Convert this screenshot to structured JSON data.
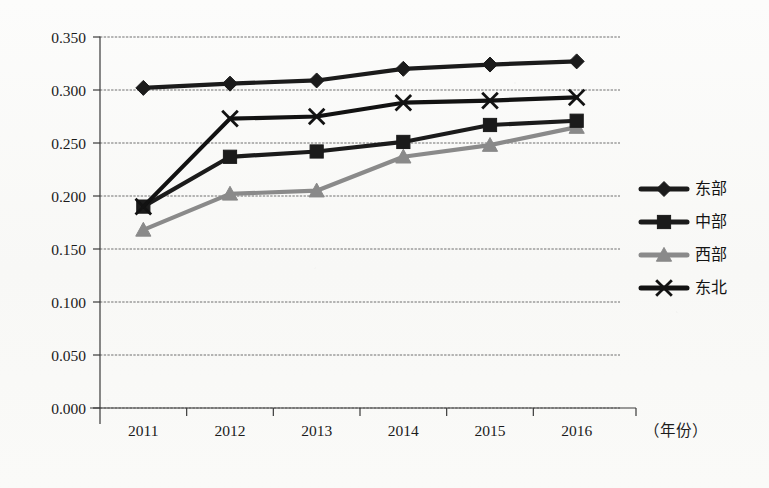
{
  "chart_data": {
    "type": "line",
    "title": "",
    "subtitle": "",
    "xlabel": "（年份）",
    "ylabel": "",
    "x": [
      "2011",
      "2012",
      "2013",
      "2014",
      "2015",
      "2016"
    ],
    "categories": [
      "2011",
      "2012",
      "2013",
      "2014",
      "2015",
      "2016"
    ],
    "ylim": [
      0.0,
      0.35
    ],
    "ytick_step": 0.05,
    "ytick_labels": [
      "0.000",
      "0.050",
      "0.100",
      "0.150",
      "0.200",
      "0.250",
      "0.300",
      "0.350"
    ],
    "ytick_values": [
      0.0,
      0.05,
      0.1,
      0.15,
      0.2,
      0.25,
      0.3,
      0.35
    ],
    "grid": true,
    "grid_axis": "y",
    "legend_position": "right",
    "series": [
      {
        "name": "东部",
        "marker": "diamond",
        "color": "#1b1b1b",
        "values": [
          0.302,
          0.306,
          0.309,
          0.32,
          0.324,
          0.327
        ]
      },
      {
        "name": "中部",
        "marker": "square",
        "color": "#1b1b1b",
        "values": [
          0.19,
          0.237,
          0.242,
          0.251,
          0.267,
          0.271
        ]
      },
      {
        "name": "西部",
        "marker": "triangle",
        "color": "#8a8a8a",
        "values": [
          0.168,
          0.202,
          0.205,
          0.237,
          0.248,
          0.265
        ]
      },
      {
        "name": "东北",
        "marker": "cross",
        "color": "#121212",
        "values": [
          0.19,
          0.273,
          0.275,
          0.288,
          0.29,
          0.293
        ]
      }
    ]
  },
  "legend": {
    "items": [
      {
        "label": "东部",
        "marker": "diamond",
        "color": "#1b1b1b"
      },
      {
        "label": "中部",
        "marker": "square",
        "color": "#1b1b1b"
      },
      {
        "label": "西部",
        "marker": "triangle",
        "color": "#8a8a8a"
      },
      {
        "label": "东北",
        "marker": "cross",
        "color": "#121212"
      }
    ]
  },
  "axes": {
    "x_axis_unit_label": "（年份）"
  }
}
